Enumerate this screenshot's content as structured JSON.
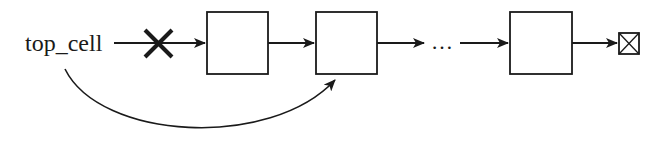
{
  "diagram": {
    "type": "linked-list-removal",
    "head_label": "top_cell",
    "removed_marker": "X",
    "ellipsis": "…",
    "nodes": [
      {
        "id": "node-1",
        "label": ""
      },
      {
        "id": "node-2",
        "label": ""
      },
      {
        "id": "node-3",
        "label": ""
      }
    ],
    "terminator": "null-box",
    "edges": [
      {
        "from": "top_cell",
        "to": "node-1",
        "state": "removed"
      },
      {
        "from": "node-1",
        "to": "node-2"
      },
      {
        "from": "node-2",
        "to": "ellipsis"
      },
      {
        "from": "ellipsis",
        "to": "node-3"
      },
      {
        "from": "node-3",
        "to": "terminator"
      },
      {
        "from": "top_cell",
        "to": "node-2",
        "style": "curved"
      }
    ],
    "stroke_color": "#1a1a1a"
  }
}
